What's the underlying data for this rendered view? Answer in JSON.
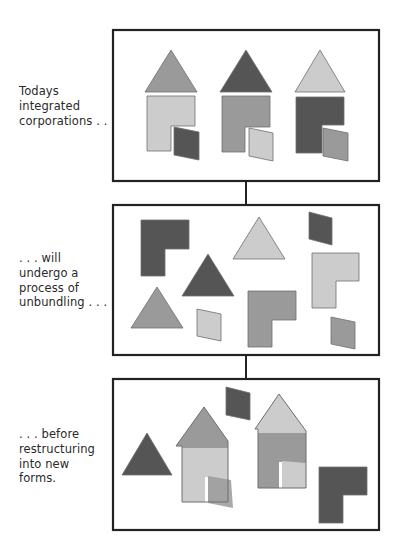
{
  "diagram": {
    "colors": {
      "dark": "#555555",
      "mid": "#9a9a9a",
      "light": "#cccccc",
      "outline": "#6e6e6e",
      "frame": "#222222"
    },
    "stages": [
      {
        "id": "integrated",
        "caption_lines": [
          "Todays",
          "integrated",
          "corporations . . ."
        ]
      },
      {
        "id": "unbundling",
        "caption_lines": [
          ". . . will",
          "undergo a",
          "process of",
          "unbundling . . ."
        ]
      },
      {
        "id": "restructuring",
        "caption_lines": [
          ". . . before",
          "restructuring",
          "into new",
          "forms."
        ]
      }
    ],
    "shape_types": [
      "triangle-roof",
      "l-shape-body",
      "parallelogram-door"
    ]
  }
}
